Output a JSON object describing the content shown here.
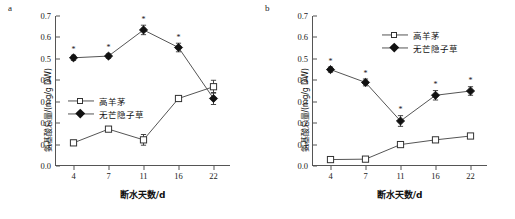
{
  "figure": {
    "panels": [
      {
        "panel_label": "a",
        "legend": [
          {
            "name": "高羊茅",
            "marker": "open-square"
          },
          {
            "name": "无芒隐子草",
            "marker": "filled-diamond"
          }
        ]
      },
      {
        "panel_label": "b",
        "legend": [
          {
            "name": "高羊茅",
            "marker": "open-square"
          },
          {
            "name": "无芒隐子草",
            "marker": "filled-diamond"
          }
        ]
      }
    ]
  },
  "chart_data": [
    {
      "type": "line",
      "panel": "a",
      "title": "",
      "xlabel": "断水天数/d",
      "ylabel": "氨基酸总量/(mg/g DW)",
      "categories": [
        "4",
        "7",
        "11",
        "16",
        "22"
      ],
      "ylim": [
        0.0,
        0.7
      ],
      "yticks": [
        "0.0",
        "0.1",
        "0.2",
        "0.3",
        "0.4",
        "0.5",
        "0.6",
        "0.7"
      ],
      "grid": false,
      "legend_position": "center-left",
      "series": [
        {
          "name": "高羊茅",
          "marker": "open-square",
          "values": [
            0.108,
            0.172,
            0.122,
            0.315,
            0.37
          ],
          "errors": [
            0.012,
            0.01,
            0.025,
            0.012,
            0.03
          ],
          "significance": [
            "",
            "",
            "",
            "",
            ""
          ]
        },
        {
          "name": "无芒隐子草",
          "marker": "filled-diamond",
          "values": [
            0.505,
            0.513,
            0.635,
            0.553,
            0.315
          ],
          "errors": [
            0.012,
            0.01,
            0.022,
            0.02,
            0.028
          ],
          "significance": [
            "*",
            "*",
            "*",
            "*",
            ""
          ]
        }
      ]
    },
    {
      "type": "line",
      "panel": "b",
      "title": "",
      "xlabel": "断水天数/d",
      "ylabel": "氨基酸总量/(mg/g DW)",
      "categories": [
        "4",
        "7",
        "11",
        "16",
        "22"
      ],
      "ylim": [
        0.0,
        0.7
      ],
      "yticks": [
        "0.0",
        "0.1",
        "0.2",
        "0.3",
        "0.4",
        "0.5",
        "0.6",
        "0.7"
      ],
      "grid": false,
      "legend_position": "top-right",
      "series": [
        {
          "name": "高羊茅",
          "marker": "open-square",
          "values": [
            0.03,
            0.032,
            0.1,
            0.122,
            0.14
          ],
          "errors": [
            0.006,
            0.006,
            0.008,
            0.008,
            0.01
          ],
          "significance": [
            "",
            "",
            "",
            "",
            ""
          ]
        },
        {
          "name": "无芒隐子草",
          "marker": "filled-diamond",
          "values": [
            0.45,
            0.39,
            0.21,
            0.33,
            0.35
          ],
          "errors": [
            0.012,
            0.016,
            0.025,
            0.022,
            0.02
          ],
          "significance": [
            "*",
            "*",
            "*",
            "*",
            "*"
          ]
        }
      ]
    }
  ]
}
